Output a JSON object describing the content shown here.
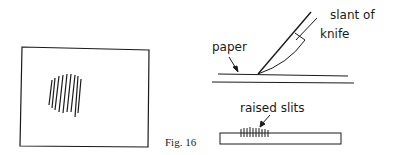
{
  "figure": {
    "caption": "Fig. 16",
    "labels": {
      "paper": "paper",
      "slant_line1": "slant of",
      "slant_line2": "knife",
      "raised_slits": "raised slits"
    },
    "colors": {
      "ink": "#1a1a1a",
      "background": "#ffffff"
    }
  }
}
